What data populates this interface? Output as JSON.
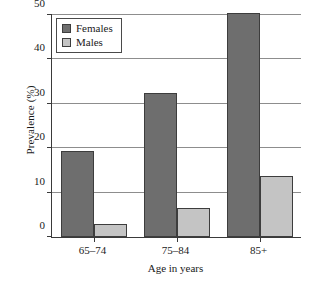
{
  "chart_data": {
    "type": "bar",
    "title": "",
    "xlabel": "Age in years",
    "ylabel": "Prevalence (%)",
    "categories": [
      "65–74",
      "75–84",
      "85+"
    ],
    "series": [
      {
        "name": "Females",
        "color": "#6e6e6e",
        "values": [
          19.3,
          32.5,
          50.5
        ]
      },
      {
        "name": "Males",
        "color": "#c4c4c4",
        "values": [
          3.0,
          6.6,
          13.8
        ]
      }
    ],
    "ylim": [
      0,
      50
    ],
    "yticks": [
      0,
      10,
      20,
      30,
      40,
      50
    ],
    "ytick_labels": [
      "0",
      "10",
      "20",
      "30",
      "40",
      "50"
    ],
    "grid": true,
    "grid_axis": "y",
    "legend_position": "upper left",
    "legend_entries": [
      "Females",
      "Males"
    ],
    "axis_color": "#3a3a3a",
    "grid_color": "#8d8d8d",
    "background": "#ffffff"
  }
}
